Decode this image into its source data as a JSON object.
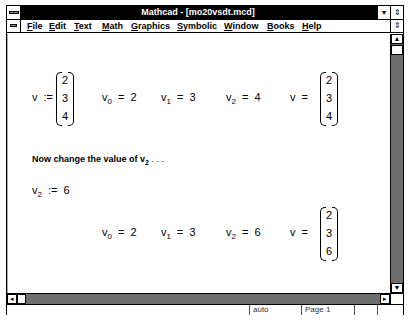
{
  "window": {
    "title": "Mathcad - [mo20vsdt.mcd]"
  },
  "titlebar_buttons": {
    "minimize": "▾",
    "restore": "⇕"
  },
  "menubar": {
    "items": [
      {
        "label": "File",
        "underline": "F",
        "rest": "ile"
      },
      {
        "label": "Edit",
        "underline": "E",
        "rest": "dit"
      },
      {
        "label": "Text",
        "underline": "T",
        "rest": "ext"
      },
      {
        "label": "Math",
        "underline": "M",
        "rest": "ath"
      },
      {
        "label": "Graphics",
        "underline": "G",
        "rest": "raphics"
      },
      {
        "label": "Symbolic",
        "underline": "S",
        "rest": "ymbolic"
      },
      {
        "label": "Window",
        "underline": "W",
        "rest": "indow"
      },
      {
        "label": "Books",
        "underline": "B",
        "rest": "ooks"
      },
      {
        "label": "Help",
        "underline": "H",
        "rest": "elp"
      }
    ],
    "restore_icon": "⇕"
  },
  "document": {
    "row1": {
      "def_var": "v",
      "def_op": ":=",
      "def_matrix": [
        "2",
        "3",
        "4"
      ],
      "eval0": {
        "var": "v",
        "sub": "0",
        "op": "=",
        "val": "2"
      },
      "eval1": {
        "var": "v",
        "sub": "1",
        "op": "=",
        "val": "3"
      },
      "eval2": {
        "var": "v",
        "sub": "2",
        "op": "=",
        "val": "4"
      },
      "eval_vec": {
        "var": "v",
        "op": "=",
        "matrix": [
          "2",
          "3",
          "4"
        ]
      }
    },
    "text_region": {
      "text": "Now change the value of v",
      "sub": "2",
      "suffix": " . . ."
    },
    "redef": {
      "var": "v",
      "sub": "2",
      "op": ":=",
      "val": "6"
    },
    "row2": {
      "eval0": {
        "var": "v",
        "sub": "0",
        "op": "=",
        "val": "2"
      },
      "eval1": {
        "var": "v",
        "sub": "1",
        "op": "=",
        "val": "3"
      },
      "eval2": {
        "var": "v",
        "sub": "2",
        "op": "=",
        "val": "6"
      },
      "eval_vec": {
        "var": "v",
        "op": "=",
        "matrix": [
          "2",
          "3",
          "6"
        ]
      }
    }
  },
  "scrollbars": {
    "up_arrow": "▲",
    "left_arrow": "◂",
    "right_arrow": "▸"
  },
  "statusbar": {
    "mode": "auto",
    "page": "Page 1",
    "cell3": "",
    "cell4": ""
  }
}
